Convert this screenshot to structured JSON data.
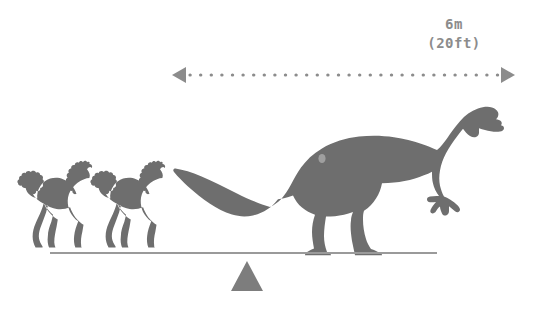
{
  "canvas": {
    "width": 534,
    "height": 317,
    "background": "#ffffff"
  },
  "colors": {
    "silhouette": "#6e6e6e",
    "fulcrum": "#7d7d7d",
    "scale_arrow": "#8c8c8c",
    "label_text": "#8c8c8c",
    "beam": "#9a9a9a"
  },
  "scale_bar": {
    "label_metric": "6m",
    "label_imperial": "(20ft)",
    "line_y": 75,
    "x_start": 172,
    "x_end": 515,
    "style": "dotted",
    "arrowheads": "both"
  },
  "subjects": [
    {
      "name": "horse",
      "count": 2,
      "side": "left",
      "pose": "galloping",
      "facing": "right"
    },
    {
      "name": "dinosaur",
      "count": 1,
      "side": "right",
      "pose": "walking",
      "facing": "right",
      "body_plan": "long-necked bipedal prosauropod"
    }
  ],
  "balance": {
    "beam_x_start": 50,
    "beam_x_end": 437,
    "beam_y": 253,
    "fulcrum_center_x": 247,
    "fulcrum_top_y": 261,
    "fulcrum_base_y": 291,
    "fulcrum_half_width": 16,
    "state": "level"
  },
  "icons": {
    "arrow_left": "arrow-left-icon",
    "arrow_right": "arrow-right-icon",
    "fulcrum": "triangle-fulcrum-icon",
    "horse": "horse-silhouette-icon",
    "dinosaur": "dinosaur-silhouette-icon"
  }
}
